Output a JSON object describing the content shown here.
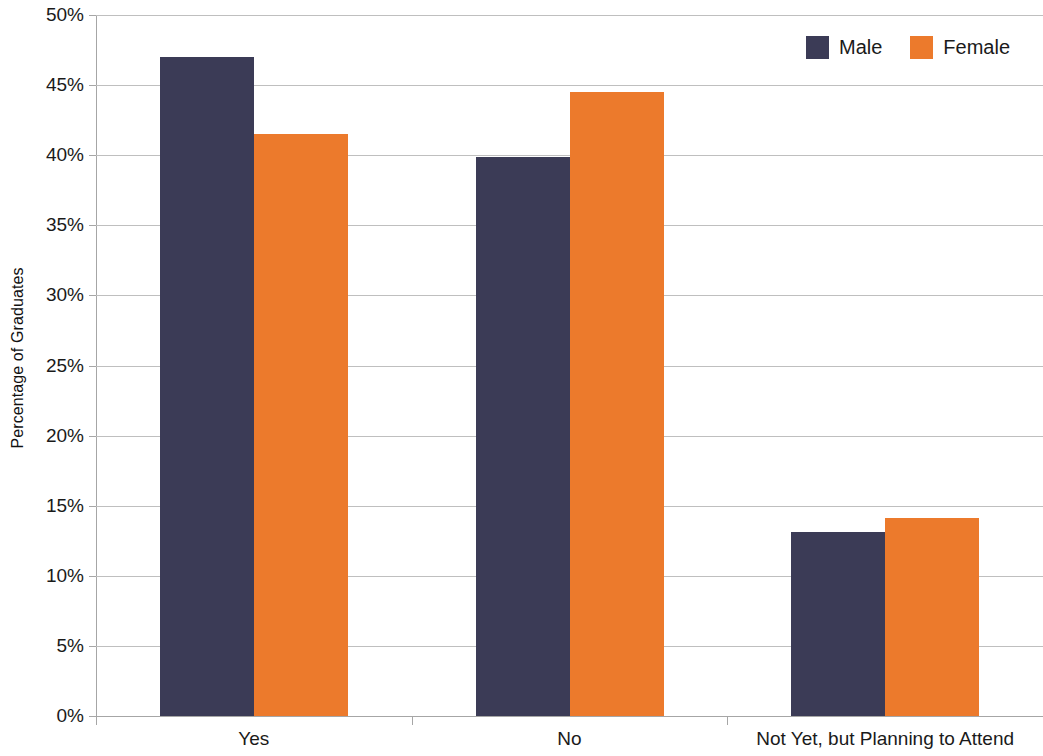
{
  "chart_data": {
    "type": "bar",
    "title": "",
    "xlabel": "",
    "ylabel": "Percentage of Graduates",
    "categories": [
      "Yes",
      "No",
      "Not Yet, but Planning to Attend"
    ],
    "series": [
      {
        "name": "Male",
        "color": "#3b3b56",
        "values": [
          47.0,
          39.9,
          13.1
        ]
      },
      {
        "name": "Female",
        "color": "#ec7a2c",
        "values": [
          41.5,
          44.5,
          14.1
        ]
      }
    ],
    "ylim": [
      0,
      50
    ],
    "ytick_values": [
      0,
      5,
      10,
      15,
      20,
      25,
      30,
      35,
      40,
      45,
      50
    ],
    "ytick_labels": [
      "0%",
      "5%",
      "10%",
      "15%",
      "20%",
      "25%",
      "30%",
      "35%",
      "40%",
      "45%",
      "50%"
    ],
    "grid": true,
    "grid_axis": "y",
    "legend_position": "top-right",
    "bar_gap_within_group": 0
  },
  "legend": {
    "entries": [
      {
        "label": "Male",
        "color": "#3b3b56"
      },
      {
        "label": "Female",
        "color": "#ec7a2c"
      }
    ]
  },
  "axis": {
    "y_title": "Percentage of Graduates"
  }
}
